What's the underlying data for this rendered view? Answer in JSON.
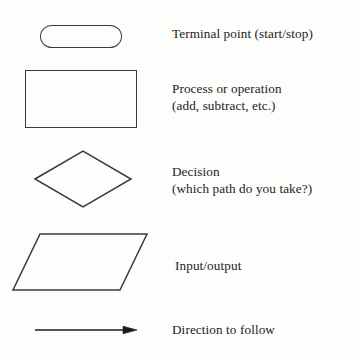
{
  "figure": {
    "background_color": "#fdfdfb",
    "stroke_color": "#3a3a3a",
    "text_color": "#1b1b1b"
  },
  "rows": [
    {
      "shape": "stadium",
      "shape_name": "terminal-point-shape",
      "label_lines": [
        "Terminal point (start/stop)"
      ]
    },
    {
      "shape": "rectangle",
      "shape_name": "process-shape",
      "label_lines": [
        "Process or operation",
        "(add, subtract, etc.)"
      ]
    },
    {
      "shape": "diamond",
      "shape_name": "decision-shape",
      "label_lines": [
        "Decision",
        "(which path do you take?)"
      ]
    },
    {
      "shape": "parallelogram",
      "shape_name": "input-output-shape",
      "label_lines": [
        "Input/output"
      ]
    },
    {
      "shape": "arrow",
      "shape_name": "direction-arrow-shape",
      "label_lines": [
        "Direction to follow"
      ]
    }
  ]
}
